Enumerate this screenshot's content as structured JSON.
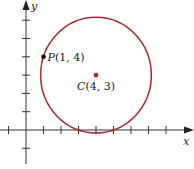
{
  "diagram": {
    "axes": {
      "x_label": "x",
      "y_label": "y",
      "x_ticks": [
        -1,
        1,
        2,
        3,
        4,
        5,
        6,
        7,
        8
      ],
      "y_ticks": [
        -1,
        1,
        2,
        3,
        4,
        5,
        6
      ]
    },
    "circle": {
      "center": [
        4,
        3
      ],
      "radius_squared": 10,
      "color": "#a8282c"
    },
    "points": [
      {
        "name": "P",
        "coords": [
          1,
          4
        ],
        "label": "P(1, 4)",
        "color": "#111111"
      },
      {
        "name": "C",
        "coords": [
          4,
          3
        ],
        "label": "C(4, 3)",
        "color": "#b01e23"
      }
    ]
  }
}
